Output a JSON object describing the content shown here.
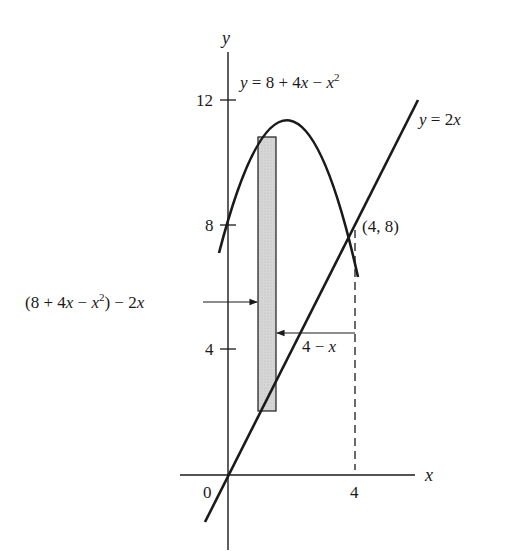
{
  "diagram": {
    "axes": {
      "x_label": "x",
      "y_label": "y",
      "origin_label": "0",
      "x_ticks": [
        {
          "value": 4,
          "label": "4"
        }
      ],
      "y_ticks": [
        {
          "value": 4,
          "label": "4"
        },
        {
          "value": 8,
          "label": "8"
        },
        {
          "value": 12,
          "label": "12"
        }
      ]
    },
    "curves": {
      "parabola": {
        "label_prefix": "y = 8 + 4",
        "label_x": "x",
        "label_minus": " − ",
        "label_x2": "x",
        "label_exp": "2",
        "equation": "y = 8 + 4x − x^2"
      },
      "line": {
        "label_y": "y",
        "label_rest": " = 2",
        "label_x": "x",
        "equation": "y = 2x"
      }
    },
    "intersection": {
      "label": "(4, 8)",
      "x": 4,
      "y": 8
    },
    "annotations": {
      "height_label": {
        "open": "(8 + 4",
        "x1": "x",
        "minus": " − ",
        "x2": "x",
        "exp": "2",
        "close": ") − 2",
        "x3": "x",
        "text": "(8 + 4x − x^2) − 2x"
      },
      "width_label": {
        "prefix": "4 − ",
        "x": "x",
        "text": "4 − x"
      }
    },
    "colors": {
      "ink": "#1a1a1a",
      "strip_fill": "#d4d4d4",
      "background": "#ffffff"
    }
  }
}
